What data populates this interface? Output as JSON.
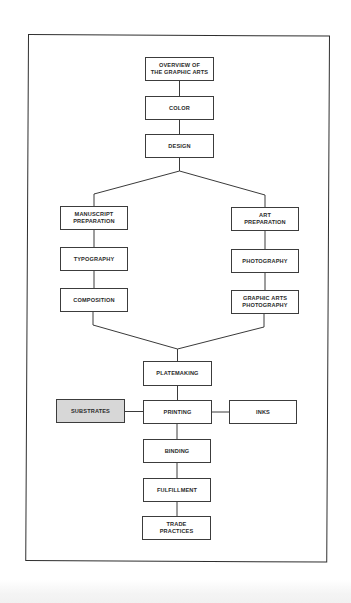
{
  "diagram": {
    "type": "flowchart",
    "colors": {
      "line": "#3a3a3a",
      "box_border": "#3c3c3c",
      "box_fill": "#ffffff",
      "highlight_fill": "#d7d7d7",
      "text": "#2a2a2a"
    },
    "nodes": {
      "overview": {
        "label": "OVERVIEW  OF\nTHE  GRAPHIC  ARTS"
      },
      "color": {
        "label": "COLOR"
      },
      "design": {
        "label": "DESIGN"
      },
      "manuscript": {
        "label": "MANUSCRIPT\nPREPARATION"
      },
      "typography": {
        "label": "TYPOGRAPHY"
      },
      "composition": {
        "label": "COMPOSITION"
      },
      "art": {
        "label": "ART\nPREPARATION"
      },
      "photography": {
        "label": "PHOTOGRAPHY"
      },
      "graphic_arts_photography": {
        "label": "GRAPHIC  ARTS\nPHOTOGRAPHY"
      },
      "platemaking": {
        "label": "PLATEMAKING"
      },
      "substrates": {
        "label": "SUBSTRATES",
        "highlighted": true
      },
      "printing": {
        "label": "PRINTING"
      },
      "inks": {
        "label": "INKS"
      },
      "binding": {
        "label": "BINDING"
      },
      "fulfillment": {
        "label": "FULFILLMENT"
      },
      "trade_practices": {
        "label": "TRADE\nPRACTICES"
      }
    },
    "edges": [
      [
        "overview",
        "color"
      ],
      [
        "color",
        "design"
      ],
      [
        "design",
        "manuscript"
      ],
      [
        "design",
        "art"
      ],
      [
        "manuscript",
        "typography"
      ],
      [
        "typography",
        "composition"
      ],
      [
        "art",
        "photography"
      ],
      [
        "photography",
        "graphic_arts_photography"
      ],
      [
        "composition",
        "platemaking"
      ],
      [
        "graphic_arts_photography",
        "platemaking"
      ],
      [
        "platemaking",
        "printing"
      ],
      [
        "substrates",
        "printing"
      ],
      [
        "inks",
        "printing"
      ],
      [
        "printing",
        "binding"
      ],
      [
        "binding",
        "fulfillment"
      ],
      [
        "fulfillment",
        "trade_practices"
      ]
    ]
  }
}
